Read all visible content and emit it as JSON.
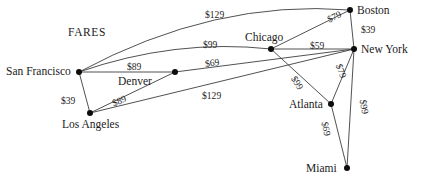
{
  "title": {
    "text": "FARES",
    "x": 68,
    "y": 27
  },
  "style": {
    "edge_color": "#3d3d3d",
    "node_color": "#0d0d0d",
    "text_color": "#1a1a1a",
    "background": "#ffffff"
  },
  "graph_data": {
    "type": "diagram",
    "diagram_kind": "weighted-graph-airline-fares",
    "currency": "$",
    "nodes": [
      {
        "id": "san-francisco",
        "label": "San Francisco",
        "x": 79,
        "y": 72,
        "label_x": 6,
        "label_y": 66,
        "label_anchor": "left"
      },
      {
        "id": "denver",
        "label": "Denver",
        "x": 175,
        "y": 72,
        "label_x": 118,
        "label_y": 76,
        "label_anchor": "left"
      },
      {
        "id": "los-angeles",
        "label": "Los Angeles",
        "x": 90,
        "y": 113,
        "label_x": 62,
        "label_y": 119,
        "label_anchor": "left"
      },
      {
        "id": "chicago",
        "label": "Chicago",
        "x": 271,
        "y": 49,
        "label_x": 245,
        "label_y": 32,
        "label_anchor": "left"
      },
      {
        "id": "boston",
        "label": "Boston",
        "x": 350,
        "y": 10,
        "label_x": 357,
        "label_y": 5,
        "label_anchor": "left"
      },
      {
        "id": "new-york",
        "label": "New York",
        "x": 354,
        "y": 49,
        "label_x": 361,
        "label_y": 44,
        "label_anchor": "left"
      },
      {
        "id": "atlanta",
        "label": "Atlanta",
        "x": 331,
        "y": 104,
        "label_x": 289,
        "label_y": 99,
        "label_anchor": "left"
      },
      {
        "id": "miami",
        "label": "Miami",
        "x": 347,
        "y": 168,
        "label_x": 306,
        "label_y": 163,
        "label_anchor": "left"
      }
    ],
    "edges": [
      {
        "from": "san-francisco",
        "to": "boston",
        "fare": 129,
        "label": "$129",
        "curved": true,
        "curve_cy": -42,
        "label_x": 205,
        "label_y": 10,
        "rotate": 0
      },
      {
        "from": "san-francisco",
        "to": "chicago",
        "fare": 99,
        "label": "$99",
        "curved": true,
        "curve_cy": -22,
        "label_x": 203,
        "label_y": 40,
        "rotate": 0
      },
      {
        "from": "san-francisco",
        "to": "denver",
        "fare": 89,
        "label": "$89",
        "curved": false,
        "label_x": 127,
        "label_y": 62,
        "rotate": 0
      },
      {
        "from": "san-francisco",
        "to": "los-angeles",
        "fare": 39,
        "label": "$39",
        "curved": false,
        "label_x": 61,
        "label_y": 96,
        "rotate": 0
      },
      {
        "from": "los-angeles",
        "to": "denver",
        "fare": 89,
        "label": "$89",
        "curved": false,
        "label_x": 112,
        "label_y": 96,
        "rotate": -22
      },
      {
        "from": "los-angeles",
        "to": "new-york",
        "fare": 129,
        "label": "$129",
        "curved": false,
        "label_x": 202,
        "label_y": 91,
        "rotate": 0
      },
      {
        "from": "denver",
        "to": "new-york",
        "fare": 69,
        "label": "$69",
        "curved": false,
        "label_x": 205,
        "label_y": 58,
        "rotate": -8
      },
      {
        "from": "chicago",
        "to": "new-york",
        "fare": 59,
        "label": "$59",
        "curved": false,
        "label_x": 310,
        "label_y": 41,
        "rotate": 0
      },
      {
        "from": "chicago",
        "to": "boston",
        "fare": 79,
        "label": "$79",
        "curved": false,
        "label_x": 327,
        "label_y": 12,
        "rotate": -26
      },
      {
        "from": "boston",
        "to": "new-york",
        "fare": 39,
        "label": "$39",
        "curved": false,
        "label_x": 361,
        "label_y": 25,
        "rotate": 0
      },
      {
        "from": "chicago",
        "to": "atlanta",
        "fare": 99,
        "label": "$99",
        "curved": false,
        "label_x": 290,
        "label_y": 78,
        "rotate": 58
      },
      {
        "from": "atlanta",
        "to": "new-york",
        "fare": 79,
        "label": "$79",
        "curved": false,
        "label_x": 334,
        "label_y": 66,
        "rotate": 70
      },
      {
        "from": "atlanta",
        "to": "miami",
        "fare": 69,
        "label": "$69",
        "curved": false,
        "label_x": 319,
        "label_y": 124,
        "rotate": 78
      },
      {
        "from": "new-york",
        "to": "miami",
        "fare": 99,
        "label": "$99",
        "curved": false,
        "label_x": 357,
        "label_y": 102,
        "rotate": 80
      }
    ]
  }
}
